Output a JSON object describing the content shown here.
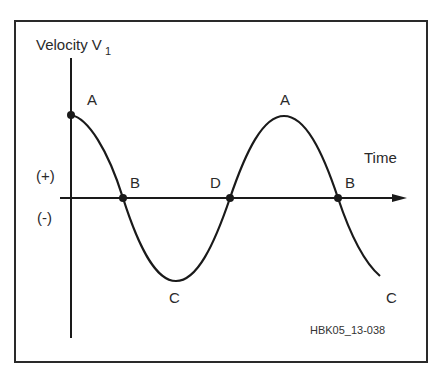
{
  "diagram": {
    "y_axis_label": "Velocity V",
    "y_axis_subscript": "1",
    "x_axis_label": "Time",
    "positive_label": "(+)",
    "negative_label": "(-)",
    "figure_code": "HBK05_13-038",
    "points": [
      {
        "label": "A",
        "description": "start maximum on velocity axis"
      },
      {
        "label": "B",
        "description": "first zero crossing"
      },
      {
        "label": "C",
        "description": "minimum (trough)"
      },
      {
        "label": "D",
        "description": "second zero crossing"
      },
      {
        "label": "A",
        "description": "second maximum (peak)"
      },
      {
        "label": "B",
        "description": "third zero crossing"
      },
      {
        "label": "C",
        "description": "curve end heading to minimum"
      }
    ],
    "colors": {
      "line": "#1a1a1a",
      "frame": "#2a2a2a",
      "background": "#ffffff"
    }
  }
}
